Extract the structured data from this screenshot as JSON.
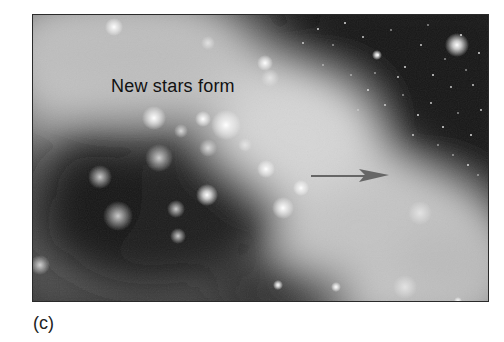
{
  "figure": {
    "panel_label": "New stars form",
    "caption": "(c)",
    "arrow": {
      "direction": "right",
      "color": "#6a6a6a"
    },
    "colors": {
      "background": "#ffffff",
      "space_dark": "#151515",
      "nebula_light": "#d8d8d8",
      "frame": "#2a2a2a"
    },
    "icons": {
      "arrow": "arrow-right-icon",
      "stars": "star-glow-icon"
    }
  }
}
